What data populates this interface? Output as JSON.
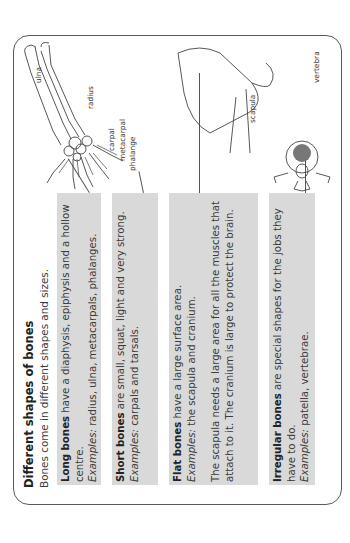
{
  "heading": {
    "title": "Different shapes of bones",
    "subtitle": "Bones come in different shapes and sizes."
  },
  "bone_types": [
    {
      "name": "Long bones",
      "description": " have a diaphysis, epiphysis and a hollow centre.",
      "examples_label": "Examples:",
      "examples": " radius, ulna, metacarpals, phalanges."
    },
    {
      "name": "Short bones",
      "description": " are small, squat, light and very strong.",
      "examples_label": "Examples:",
      "examples": " carpals and tarsals."
    },
    {
      "name": "Flat bones",
      "description": " have a large surface area.",
      "examples_label": "Examples:",
      "examples": " the scapula and cranium.",
      "note": "The scapula needs a large area for all the muscles that attach to it. The cranium is large to protect the brain."
    },
    {
      "name": "Irregular bones",
      "description": " are special shapes for the jobs they have to do.",
      "examples_label": "Examples:",
      "examples": " patella, vertebrae."
    }
  ],
  "diagram_labels": {
    "ulna": "ulna",
    "radius": "radius",
    "carpal": "carpal",
    "metacarpal": "metacarpal",
    "phalange": "phalange",
    "scapula": "scapula",
    "vertebra": "vertebra"
  },
  "colors": {
    "box_fill": "#d9d9d9",
    "border": "#5a5a5a",
    "text": "#3a3a3a"
  }
}
